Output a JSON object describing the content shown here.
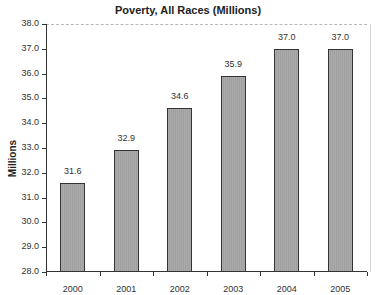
{
  "chart_data": {
    "type": "bar",
    "title": "Poverty, All Races (Millions)",
    "xlabel": "",
    "ylabel": "Millions",
    "categories": [
      "2000",
      "2001",
      "2002",
      "2003",
      "2004",
      "2005"
    ],
    "values": [
      31.6,
      32.9,
      34.6,
      35.9,
      37.0,
      37.0
    ],
    "value_labels": [
      "31.6",
      "32.9",
      "34.6",
      "35.9",
      "37.0",
      "37.0"
    ],
    "ylim": [
      28.0,
      38.0
    ],
    "yticks": [
      "28.0",
      "29.0",
      "30.0",
      "31.0",
      "32.0",
      "33.0",
      "34.0",
      "35.0",
      "36.0",
      "37.0",
      "38.0"
    ],
    "grid": false,
    "legend": null,
    "bar_color": "#a6a6a6"
  }
}
